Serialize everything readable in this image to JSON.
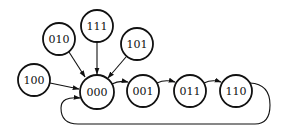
{
  "diagram": {
    "type": "state-transition-graph",
    "colors": {
      "stroke": "#111111",
      "background": "#ffffff",
      "node_fill": "#ffffff"
    },
    "nodes": [
      {
        "id": "100",
        "label": "100",
        "x": 34,
        "y": 80,
        "r": 16
      },
      {
        "id": "010",
        "label": "010",
        "x": 59,
        "y": 39,
        "r": 16
      },
      {
        "id": "111",
        "label": "111",
        "x": 97,
        "y": 26,
        "r": 16
      },
      {
        "id": "101",
        "label": "101",
        "x": 137,
        "y": 44,
        "r": 16
      },
      {
        "id": "000",
        "label": "000",
        "x": 97,
        "y": 92,
        "r": 17
      },
      {
        "id": "001",
        "label": "001",
        "x": 143,
        "y": 91,
        "r": 16
      },
      {
        "id": "011",
        "label": "011",
        "x": 190,
        "y": 91,
        "r": 16
      },
      {
        "id": "110",
        "label": "110",
        "x": 236,
        "y": 91,
        "r": 16
      }
    ],
    "edges": [
      {
        "from": "100",
        "to": "000"
      },
      {
        "from": "010",
        "to": "000"
      },
      {
        "from": "111",
        "to": "000"
      },
      {
        "from": "101",
        "to": "000"
      },
      {
        "from": "000",
        "to": "001"
      },
      {
        "from": "001",
        "to": "011"
      },
      {
        "from": "011",
        "to": "110"
      },
      {
        "from": "110",
        "to": "000",
        "style": "loop-below"
      }
    ]
  }
}
